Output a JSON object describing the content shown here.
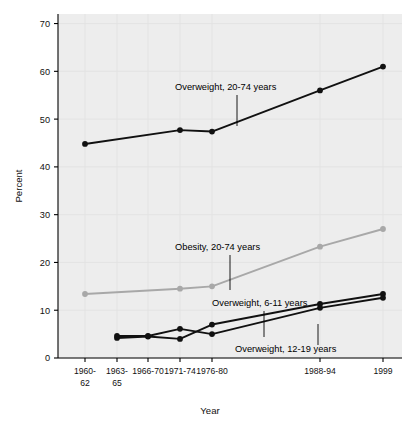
{
  "chart_data": {
    "type": "line",
    "title": "",
    "xlabel": "Year",
    "ylabel": "Percent",
    "ylim": [
      0,
      72
    ],
    "yticks": [
      0,
      10,
      20,
      30,
      40,
      50,
      60,
      70
    ],
    "grid": true,
    "legend_position": "inline-annotations",
    "categories": [
      "1960-62",
      "1963-65",
      "1966-70",
      "1971-74",
      "1976-80",
      "1988-94",
      "1999"
    ],
    "category_lines": [
      [
        "1960-",
        "62"
      ],
      [
        "1963-",
        "65"
      ],
      [
        "1966-70",
        ""
      ],
      [
        "1971-74",
        ""
      ],
      [
        "1976-80",
        ""
      ],
      [
        "1988-94",
        ""
      ],
      [
        "1999",
        ""
      ]
    ],
    "series": [
      {
        "name": "Overweight, 20-74 years",
        "color": "#111111",
        "values": [
          44.8,
          null,
          null,
          47.7,
          47.4,
          56.0,
          61.0
        ]
      },
      {
        "name": "Obesity, 20-74 years",
        "color": "#a8a8a8",
        "values": [
          13.4,
          null,
          null,
          14.5,
          15.0,
          23.3,
          27.0
        ]
      },
      {
        "name": "Overweight, 6-11 years",
        "color": "#111111",
        "values": [
          null,
          4.2,
          4.5,
          4.0,
          7.0,
          11.3,
          13.4
        ]
      },
      {
        "name": "Overweight, 12-19 years",
        "color": "#111111",
        "values": [
          null,
          4.6,
          4.6,
          6.1,
          5.0,
          10.5,
          12.6
        ]
      }
    ],
    "annotations": [
      {
        "text": "Overweight, 20-74 years",
        "x": 175,
        "y": 90
      },
      {
        "text": "Obesity, 20-74 years",
        "x": 175,
        "y": 250
      },
      {
        "text": "Overweight, 6-11 years",
        "x": 212,
        "y": 306
      },
      {
        "text": "Overweight, 12-19 years",
        "x": 235,
        "y": 352
      }
    ]
  },
  "axes": {
    "y_title": "Percent",
    "x_title": "Year",
    "y_tick_labels": [
      "0",
      "10",
      "20",
      "30",
      "40",
      "50",
      "60",
      "70"
    ],
    "x_tick_labels_top": [
      "1960-",
      "1963-",
      "1966-70",
      "1971-74",
      "1976-80",
      "1988-94",
      "1999"
    ],
    "x_tick_labels_bottom": [
      "62",
      "65",
      "",
      "",
      "",
      "",
      ""
    ]
  },
  "annotation_labels": {
    "overweight_adults": "Overweight, 20-74 years",
    "obesity_adults": "Obesity, 20-74 years",
    "overweight_children": "Overweight, 6-11 years",
    "overweight_teens": "Overweight, 12-19 years"
  },
  "colors": {
    "line_dark": "#111111",
    "line_gray": "#a8a8a8",
    "plot_background": "#ededed",
    "grid": "#e2e2e2",
    "page_background": "#ffffff"
  }
}
